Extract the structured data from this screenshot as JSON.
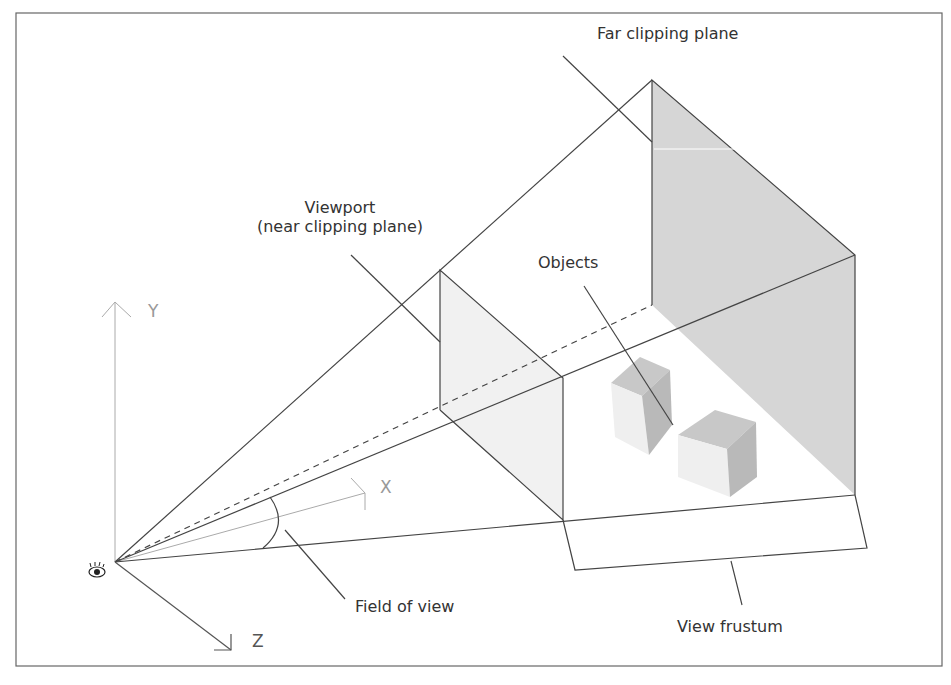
{
  "diagram": {
    "labels": {
      "far_clipping_plane": "Far clipping plane",
      "viewport_line1": "Viewport",
      "viewport_line2": "(near clipping plane)",
      "objects": "Objects",
      "field_of_view": "Field of view",
      "view_frustum": "View frustum"
    },
    "axes": {
      "y": "Y",
      "x": "X",
      "z": "Z"
    },
    "icons": {
      "eye": "eye-icon"
    },
    "colors": {
      "line": "#444444",
      "axis": "#aaaaaa",
      "far_plane_fill": "#d6d6d6",
      "near_plane_fill": "#f0f0f0",
      "frame": "#555555"
    }
  }
}
